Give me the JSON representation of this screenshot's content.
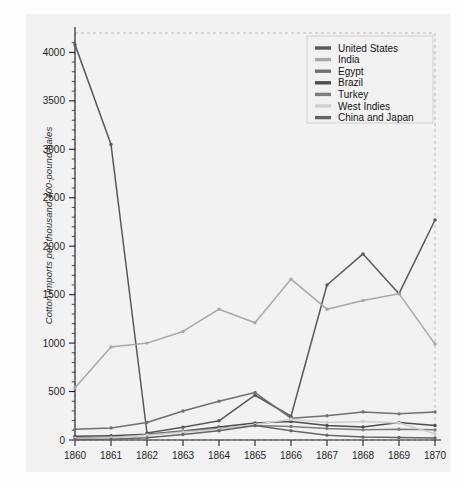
{
  "chart_data": {
    "type": "line",
    "title": "",
    "xlabel": "",
    "ylabel": "Cotton imports per thousand 400-pound bales",
    "x": [
      1860,
      1861,
      1862,
      1863,
      1864,
      1865,
      1866,
      1867,
      1868,
      1869,
      1870
    ],
    "xtick_labels": [
      "1860",
      "1861",
      "1862",
      "1863",
      "1864",
      "1865",
      "1866",
      "1867",
      "1868",
      "1869",
      "1870"
    ],
    "ytick_labels": [
      "0",
      "500",
      "1000",
      "1500",
      "2000",
      "2500",
      "3000",
      "3500",
      "4000"
    ],
    "yticks": [
      0,
      500,
      1000,
      1500,
      2000,
      2500,
      3000,
      3500,
      4000
    ],
    "xlim": [
      1860,
      1870
    ],
    "ylim": [
      0,
      4200
    ],
    "grid": false,
    "minor_ticks": true,
    "legend_position": "upper right",
    "series": [
      {
        "name": "United States",
        "color": "#59595b",
        "values": [
          4080,
          3050,
          72,
          132,
          198,
          462,
          245,
          1600,
          1920,
          1510,
          2270
        ]
      },
      {
        "name": "India",
        "color": "#a8a8aa",
        "values": [
          540,
          960,
          1000,
          1120,
          1350,
          1210,
          1660,
          1350,
          1440,
          1510,
          990
        ]
      },
      {
        "name": "Egypt",
        "color": "#707072",
        "values": [
          110,
          125,
          180,
          300,
          400,
          490,
          225,
          250,
          290,
          270,
          290
        ]
      },
      {
        "name": "Brazil",
        "color": "#4d4d4f",
        "values": [
          38,
          45,
          60,
          92,
          135,
          175,
          190,
          150,
          135,
          180,
          150
        ]
      },
      {
        "name": "Turkey",
        "color": "#7d7d7f",
        "values": [
          20,
          28,
          55,
          90,
          118,
          150,
          140,
          118,
          105,
          112,
          105
        ]
      },
      {
        "name": "West Indies",
        "color": "#cfcfd1",
        "values": [
          16,
          24,
          48,
          80,
          112,
          160,
          215,
          180,
          190,
          175,
          65
        ]
      },
      {
        "name": "China and Japan",
        "color": "#656567",
        "values": [
          5,
          8,
          22,
          58,
          95,
          150,
          95,
          50,
          30,
          26,
          20
        ]
      }
    ]
  },
  "legend": {
    "items": [
      {
        "label": "United States"
      },
      {
        "label": "India"
      },
      {
        "label": "Egypt"
      },
      {
        "label": "Brazil"
      },
      {
        "label": "Turkey"
      },
      {
        "label": "West Indies"
      },
      {
        "label": "China and Japan"
      }
    ]
  }
}
